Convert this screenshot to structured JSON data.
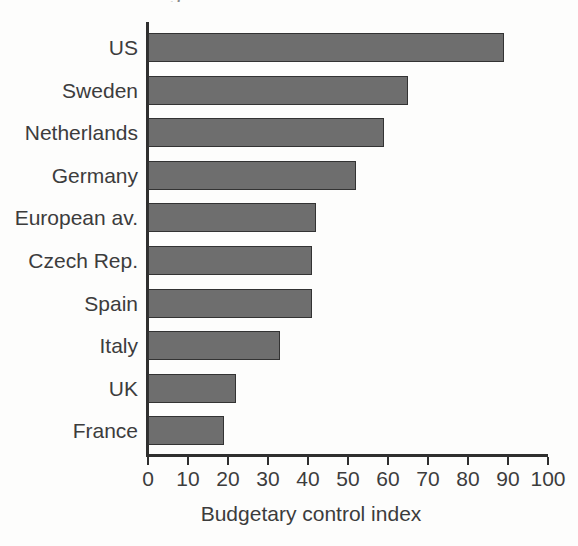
{
  "chart_data": {
    "type": "bar",
    "orientation": "horizontal",
    "title": "",
    "xlabel": "Budgetary control index",
    "ylabel": "",
    "xlim": [
      0,
      100
    ],
    "grid": false,
    "legend": null,
    "categories": [
      "US",
      "Sweden",
      "Netherlands",
      "Germany",
      "European av.",
      "Czech Rep.",
      "Spain",
      "Italy",
      "UK",
      "France"
    ],
    "values": [
      89,
      65,
      59,
      52,
      42,
      41,
      41,
      33,
      22,
      19
    ],
    "xticks": [
      "0",
      "10",
      "20",
      "30",
      "40",
      "50",
      "60",
      "70",
      "80",
      "90",
      "100"
    ],
    "bars": [
      {
        "label": "US",
        "value": 89
      },
      {
        "label": "Sweden",
        "value": 65
      },
      {
        "label": "Netherlands",
        "value": 59
      },
      {
        "label": "Germany",
        "value": 52
      },
      {
        "label": "European av.",
        "value": 42
      },
      {
        "label": "Czech Rep.",
        "value": 41
      },
      {
        "label": "Spain",
        "value": 41
      },
      {
        "label": "Italy",
        "value": 33
      },
      {
        "label": "UK",
        "value": 22
      },
      {
        "label": "France",
        "value": 19
      }
    ],
    "colors": {
      "bar_fill": "#6e6e6e",
      "bar_stroke": "#333333",
      "axis": "#2f2f2f",
      "text": "#3c3c3c",
      "background": "#fdfdfc"
    }
  },
  "figure": {
    "title_remnant": "g"
  }
}
